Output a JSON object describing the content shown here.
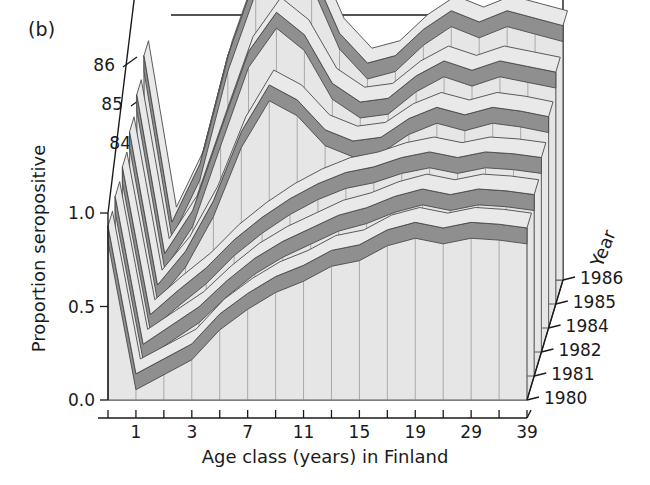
{
  "panel": {
    "label": "(b)"
  },
  "axes": {
    "xlabel": "Age class (years) in Finland",
    "ylabel": "Proportion seropositive",
    "zlabel": "Year",
    "yticks": [
      "0.0",
      "0.5",
      "1.0"
    ],
    "ytick_values": [
      0.0,
      0.5,
      1.0
    ],
    "ylim": [
      0.0,
      1.0
    ],
    "xticks": [
      "1",
      "3",
      "7",
      "11",
      "15",
      "19",
      "29",
      "39"
    ],
    "xtick_index": [
      1,
      3,
      5,
      7,
      9,
      11,
      13,
      15
    ],
    "depth_labels_left": [
      "84",
      "85",
      "86"
    ],
    "depth_labels_right": [
      "1980",
      "1981",
      "1982",
      "1984",
      "1985",
      "1986"
    ]
  },
  "colors": {
    "ribbon_top": "#e9e9e9",
    "ribbon_face": "#8f8f8f",
    "floor": "#e6e6e6",
    "outline": "#4a4a4a",
    "axis": "#1a1a1a",
    "text": "#1a1a1a"
  },
  "chart_data": {
    "type": "area",
    "title": "",
    "xlabel": "Age class (years) in Finland",
    "ylabel": "Proportion seropositive",
    "zlabel": "Year",
    "ylim": [
      0.0,
      1.0
    ],
    "grid": true,
    "legend": "none",
    "projection": "3d-ribbon",
    "categories": [
      "0",
      "1",
      "2",
      "3",
      "5",
      "7",
      "9",
      "11",
      "13",
      "15",
      "17",
      "19",
      "24",
      "29",
      "34",
      "39"
    ],
    "xtick_labels": [
      "1",
      "3",
      "7",
      "11",
      "15",
      "19",
      "29",
      "39"
    ],
    "series": [
      {
        "name": "1980",
        "values": [
          0.93,
          0.14,
          0.22,
          0.3,
          0.46,
          0.57,
          0.66,
          0.72,
          0.8,
          0.83,
          0.91,
          0.95,
          0.92,
          0.95,
          0.94,
          0.92
        ]
      },
      {
        "name": "1981",
        "values": [
          0.96,
          0.17,
          0.27,
          0.37,
          0.51,
          0.63,
          0.72,
          0.79,
          0.86,
          0.9,
          0.96,
          1.0,
          0.97,
          1.0,
          0.99,
          0.97
        ]
      },
      {
        "name": "1982",
        "values": [
          0.99,
          0.2,
          0.33,
          0.45,
          0.6,
          0.72,
          0.82,
          0.9,
          0.96,
          0.99,
          1.04,
          1.07,
          1.04,
          1.07,
          1.06,
          1.04
        ]
      },
      {
        "name": "1984",
        "values": [
          1.05,
          0.23,
          0.41,
          0.68,
          1.05,
          1.3,
          1.22,
          1.06,
          1.0,
          1.02,
          1.12,
          1.18,
          1.14,
          1.18,
          1.16,
          1.13
        ]
      },
      {
        "name": "1985",
        "values": [
          1.12,
          0.27,
          0.5,
          0.93,
          1.35,
          1.56,
          1.44,
          1.18,
          1.08,
          1.1,
          1.22,
          1.3,
          1.25,
          1.3,
          1.27,
          1.24
        ]
      },
      {
        "name": "1986",
        "values": [
          1.2,
          0.31,
          0.62,
          1.2,
          1.62,
          1.8,
          1.66,
          1.32,
          1.16,
          1.2,
          1.34,
          1.44,
          1.38,
          1.44,
          1.4,
          1.36
        ]
      }
    ]
  }
}
